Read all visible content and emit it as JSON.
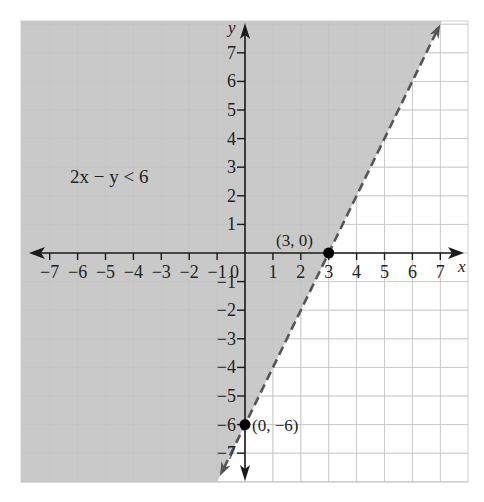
{
  "chart_data": {
    "type": "line",
    "title": "",
    "xlabel": "x",
    "ylabel": "y",
    "xlim": [
      -7.8,
      7.8
    ],
    "ylim": [
      -8,
      8
    ],
    "grid": true,
    "x_ticks": [
      -7,
      -6,
      -5,
      -4,
      -3,
      -2,
      -1,
      1,
      2,
      3,
      4,
      5,
      6,
      7
    ],
    "y_ticks": [
      -7,
      -6,
      -5,
      -4,
      -3,
      -2,
      -1,
      1,
      2,
      3,
      4,
      5,
      6,
      7
    ],
    "x_tick_labels": [
      "−7",
      "−6",
      "−5",
      "−4",
      "−3",
      "−2",
      "−1",
      "1",
      "2",
      "3",
      "4",
      "5",
      "6",
      "7"
    ],
    "y_tick_labels": [
      "−7",
      "−6",
      "−5",
      "−4",
      "−3",
      "−2",
      "−1",
      "1",
      "2",
      "3",
      "4",
      "5",
      "6",
      "7"
    ],
    "origin_label": "0",
    "boundary_line": {
      "equation": "y = 2x - 6",
      "style": "dashed",
      "x": [
        -0.9,
        7
      ],
      "y": [
        -7.8,
        8
      ]
    },
    "inequality": "2x − y < 6",
    "shaded_region": "left/above the line (2x − y < 6)",
    "points": [
      {
        "x": 3,
        "y": 0,
        "label": "(3, 0)"
      },
      {
        "x": 0,
        "y": -6,
        "label": "(0, −6)"
      }
    ]
  },
  "labels": {
    "x_axis": "x",
    "y_axis": "y",
    "origin": "0",
    "inequality": "2x − y < 6",
    "point_a": "(3, 0)",
    "point_b": "(0, −6)"
  },
  "colors": {
    "shade": "#c9c9c9",
    "grid": "#cfcfcf",
    "axis": "#1a1a1a",
    "line": "#555555",
    "point": "#000000"
  }
}
